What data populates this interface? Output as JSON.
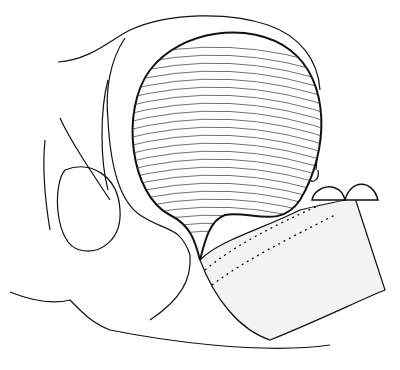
{
  "image": {
    "subject": "anatomical line drawing of a bladder-like organ in sagittal section",
    "style": "black ink engraving on white",
    "colors": {
      "ink": "#111111",
      "background": "#ffffff",
      "hatch": "#333333"
    }
  }
}
